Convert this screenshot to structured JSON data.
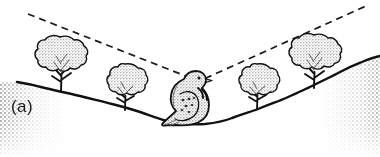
{
  "figure": {
    "panel_label": "(a)",
    "caption_visible": "",
    "width_px": 380,
    "height_px": 157,
    "background_color": "#ffffff",
    "ink_color": "#1a1a1a",
    "ground_fill_color": "#d9d9d9",
    "bird_fill_color": "#cfcfcf",
    "foliage_fill_color": "#dcdcdc"
  },
  "scene": {
    "type": "line-drawing-illustration",
    "description_visible_elements": [
      "valley-terrain",
      "four-trees",
      "perched-bird",
      "two-dashed-sightlines"
    ]
  },
  "terrain": {
    "name": "valley-ground-profile",
    "fill_color": "#d9d9d9",
    "outline_color": "#111111",
    "outline_width_px": 2.4,
    "profile_points": [
      [
        17,
        82
      ],
      [
        45,
        88
      ],
      [
        80,
        96
      ],
      [
        112,
        104
      ],
      [
        140,
        112
      ],
      [
        165,
        120
      ],
      [
        185,
        124
      ],
      [
        205,
        124
      ],
      [
        232,
        118
      ],
      [
        258,
        109
      ],
      [
        286,
        98
      ],
      [
        312,
        86
      ],
      [
        340,
        72
      ],
      [
        362,
        62
      ],
      [
        380,
        56
      ]
    ],
    "stipple": {
      "name": "ground-stipple-texture",
      "dot_color": "#8a8a8a",
      "dot_spacing_px": 4,
      "dot_radius_px": 0.9
    }
  },
  "sightlines": [
    {
      "name": "left-sightline",
      "style": "dashed",
      "color": "#1a1a1a",
      "width_px": 1.8,
      "dash_pattern": "7,5",
      "from": [
        28,
        14
      ],
      "to": [
        193,
        79
      ]
    },
    {
      "name": "right-sightline",
      "style": "dashed",
      "color": "#1a1a1a",
      "width_px": 1.8,
      "dash_pattern": "7,5",
      "from": [
        204,
        79
      ],
      "to": [
        366,
        6
      ]
    }
  ],
  "bird": {
    "name": "perched-dove",
    "species_depicted": "dove",
    "body_fill": "#cbcbcb",
    "outline_color": "#111111",
    "position": {
      "x": 162,
      "y": 70,
      "width": 52,
      "height": 56
    },
    "eye": {
      "x": 197,
      "y": 79,
      "r": 1.5
    },
    "features": [
      "head",
      "beak",
      "eye",
      "neck-bars",
      "wing-spots",
      "tail",
      "breast"
    ]
  },
  "trees": [
    {
      "name": "tree-1",
      "order": 1,
      "crown_center": {
        "x": 60,
        "y": 60
      },
      "crown_radius_x": 27,
      "crown_radius_y": 23,
      "trunk_base": {
        "x": 62,
        "y": 91
      },
      "trunk_height_px": 24,
      "fill_color": "#dcdcdc"
    },
    {
      "name": "tree-2",
      "order": 2,
      "crown_center": {
        "x": 124,
        "y": 85
      },
      "crown_radius_x": 22,
      "crown_radius_y": 20,
      "trunk_base": {
        "x": 126,
        "y": 110
      },
      "trunk_height_px": 21,
      "fill_color": "#dcdcdc"
    },
    {
      "name": "tree-3",
      "order": 3,
      "crown_center": {
        "x": 256,
        "y": 85
      },
      "crown_radius_x": 22,
      "crown_radius_y": 19,
      "trunk_base": {
        "x": 258,
        "y": 109
      },
      "trunk_height_px": 20,
      "fill_color": "#dcdcdc"
    },
    {
      "name": "tree-4",
      "order": 4,
      "crown_center": {
        "x": 314,
        "y": 58
      },
      "crown_radius_x": 26,
      "crown_radius_y": 23,
      "trunk_base": {
        "x": 316,
        "y": 88
      },
      "trunk_height_px": 25,
      "fill_color": "#dcdcdc"
    }
  ]
}
